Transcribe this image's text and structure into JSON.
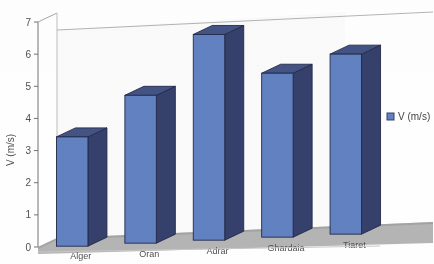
{
  "chart_data": {
    "type": "bar",
    "title": "",
    "subtitle": "",
    "xlabel": "",
    "ylabel": "V (m/s)",
    "categories": [
      "Alger",
      "Oran",
      "Adrar",
      "Ghardaia",
      "Tiaret"
    ],
    "values": [
      3.4,
      4.6,
      6.4,
      5.1,
      5.6
    ],
    "series": [
      {
        "name": "V (m/s)",
        "values": [
          3.4,
          4.6,
          6.4,
          5.1,
          5.6
        ],
        "color": "#5b7fc7"
      }
    ],
    "ylim": [
      0,
      7
    ],
    "yticks": [
      0,
      1,
      2,
      3,
      4,
      5,
      6,
      7
    ],
    "ytick_labels": [
      "0",
      "1",
      "2",
      "3",
      "4",
      "5",
      "6",
      "7"
    ],
    "grid": false,
    "three_d": true,
    "legend": {
      "position": "right",
      "entries": [
        {
          "label": "V (m/s)",
          "color": "#5b7fc7"
        }
      ]
    },
    "colors": {
      "bar_front": "#5b7fc7",
      "bar_top": "#3c4f86",
      "bar_side": "#2e3a6b",
      "bar_outline": "#1b2246",
      "floor": "#a8a8a8",
      "floor_edge": "#8c8c8c",
      "wall": "#ffffff",
      "wall_edge": "#b4b4b4",
      "axis": "#6e6e6e",
      "text": "#4a4a4a"
    }
  }
}
